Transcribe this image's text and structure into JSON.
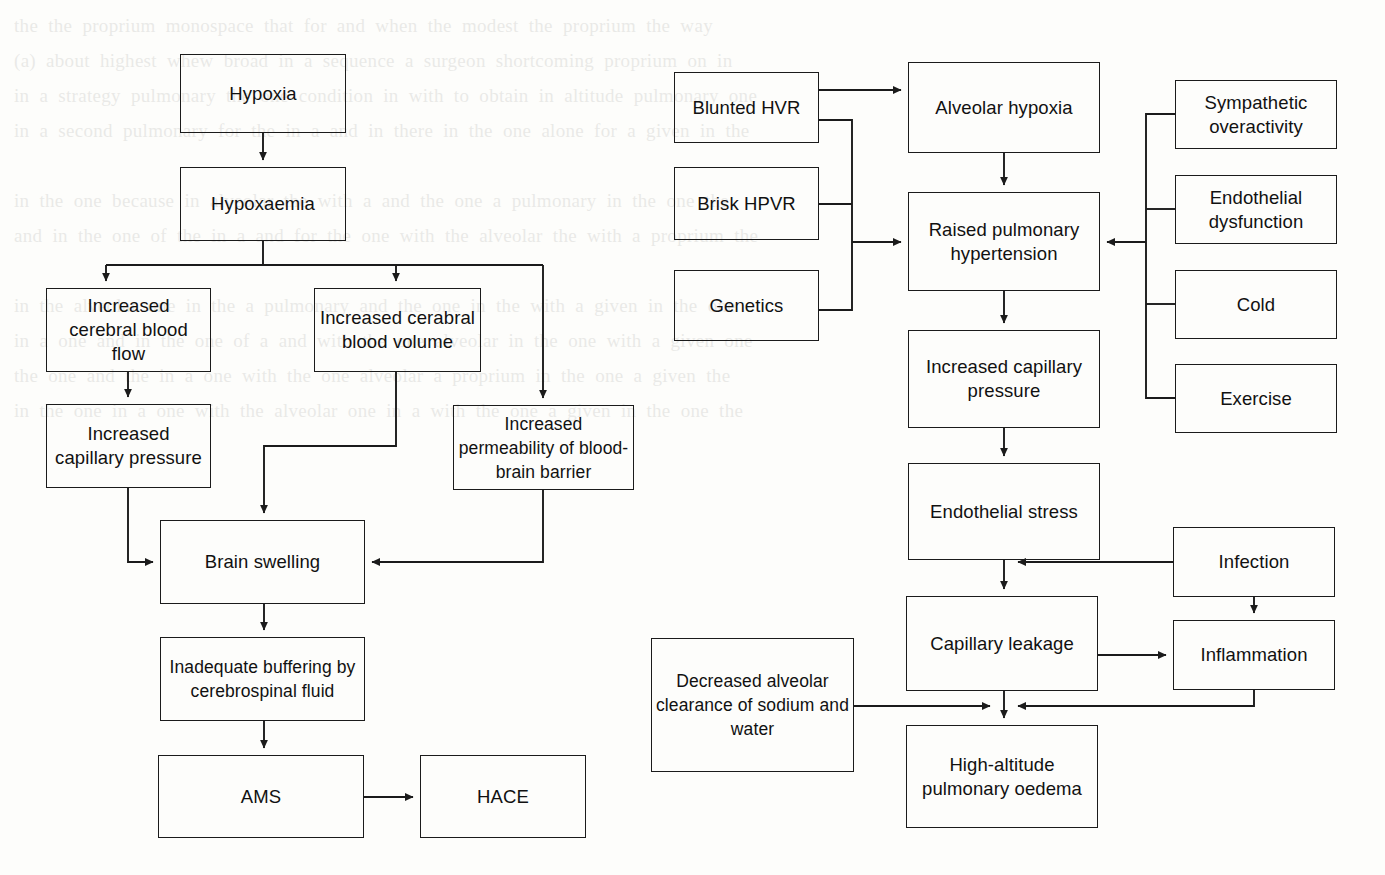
{
  "page": {
    "width": 1385,
    "height": 875,
    "background_color": "#fdfdfb",
    "node_border_color": "#1b1b1b",
    "edge_color": "#1b1b1b",
    "text_color": "#111111",
    "ghost_text": "the  the  proprium  monospace  that  for  and  when  the  modest  the  proprium  the  way\n(a)  about  highest  whew  broad  in  a  sequence  a  surgeon  shortcoming  proprium  on  in\nin  a  strategy  pulmonary  the  one  condition  in  with  to  obtain  in  altitude  pulmonary  one\nin  a  second  pulmonary  for  the  in  a  and  in  there  in  the  one  alone  for  a  given  in  the\n\nin  the  one  because  in  alveolar  the  with  a  and  the  one  a  pulmonary  in  the  one  the\nand  in  the  one  of  the  in  a  and  for  the  one  with  the  alveolar  the  with  a  proprium  the\n\nin  the  alveolar  one  in  the  a  pulmonary  and  the  one  in  the  with  a  given  in  the  one\nin  a  one  and  in  the  one  of  a  and  with  the  one  alveolar  in  the  one  with  a  given  one\nthe  one  and  the  in  a  one  with  the  one  alveolar  a  proprium  in  the  one  a  given  the\nin  the  one  in  a  one  with  the  alveolar  one  in  a  with  the  one  a  given  in  the  one  the"
  },
  "charts": [
    {
      "id": "hace-flowchart",
      "name": "High-altitude cerebral oedema pathway",
      "nodes": [
        {
          "id": "hypoxia",
          "label": "Hypoxia",
          "x": 180,
          "y": 54,
          "w": 166,
          "h": 79
        },
        {
          "id": "hypoxaemia",
          "label": "Hypoxaemia",
          "x": 180,
          "y": 167,
          "w": 166,
          "h": 74
        },
        {
          "id": "inc-cbf",
          "label": "Increased cerebral blood flow",
          "x": 46,
          "y": 288,
          "w": 165,
          "h": 84
        },
        {
          "id": "inc-cbv",
          "label": "Increased cerabral blood volume",
          "x": 314,
          "y": 288,
          "w": 167,
          "h": 84
        },
        {
          "id": "inc-cap-press",
          "label": "Increased capillary pressure",
          "x": 46,
          "y": 404,
          "w": 165,
          "h": 84
        },
        {
          "id": "inc-perm-bbb",
          "label": "Increased permeability of blood-brain barrier",
          "x": 453,
          "y": 405,
          "w": 181,
          "h": 85
        },
        {
          "id": "brain-swelling",
          "label": "Brain swelling",
          "x": 160,
          "y": 520,
          "w": 205,
          "h": 84
        },
        {
          "id": "inadequate-buffering",
          "label": "Inadequate buffering by cerebrospinal fluid",
          "x": 160,
          "y": 637,
          "w": 205,
          "h": 84
        },
        {
          "id": "ams",
          "label": "AMS",
          "x": 158,
          "y": 755,
          "w": 206,
          "h": 83
        },
        {
          "id": "hace",
          "label": "HACE",
          "x": 420,
          "y": 755,
          "w": 166,
          "h": 83
        }
      ],
      "edges": [
        {
          "from": "hypoxia",
          "to": "hypoxaemia",
          "arrow": true
        },
        {
          "from": "hypoxaemia",
          "to": "inc-cbf",
          "arrow": true
        },
        {
          "from": "hypoxaemia",
          "to": "inc-cbv",
          "arrow": true
        },
        {
          "from": "hypoxaemia",
          "to": "inc-perm-bbb",
          "arrow": true
        },
        {
          "from": "inc-cbf",
          "to": "inc-cap-press",
          "arrow": true
        },
        {
          "from": "inc-cbv",
          "to": "brain-swelling",
          "arrow": true
        },
        {
          "from": "inc-cap-press",
          "to": "brain-swelling",
          "arrow": true
        },
        {
          "from": "inc-perm-bbb",
          "to": "brain-swelling",
          "arrow": true
        },
        {
          "from": "brain-swelling",
          "to": "inadequate-buffering",
          "arrow": true
        },
        {
          "from": "inadequate-buffering",
          "to": "ams",
          "arrow": true
        },
        {
          "from": "ams",
          "to": "hace",
          "arrow": true
        }
      ]
    },
    {
      "id": "hape-flowchart",
      "name": "High-altitude pulmonary oedema pathway",
      "nodes": [
        {
          "id": "blunted-hvr",
          "label": "Blunted HVR",
          "x": 674,
          "y": 72,
          "w": 145,
          "h": 71
        },
        {
          "id": "brisk-hpvr",
          "label": "Brisk HPVR",
          "x": 674,
          "y": 167,
          "w": 145,
          "h": 73
        },
        {
          "id": "genetics",
          "label": "Genetics",
          "x": 674,
          "y": 270,
          "w": 145,
          "h": 71
        },
        {
          "id": "alveolar-hypoxia",
          "label": "Alveolar hypoxia",
          "x": 908,
          "y": 62,
          "w": 192,
          "h": 91
        },
        {
          "id": "raised-pht",
          "label": "Raised pulmonary hypertension",
          "x": 908,
          "y": 192,
          "w": 192,
          "h": 99
        },
        {
          "id": "inc-cap-pressure",
          "label": "Increased capillary pressure",
          "x": 908,
          "y": 330,
          "w": 192,
          "h": 98
        },
        {
          "id": "endothelial-stress",
          "label": "Endothelial stress",
          "x": 908,
          "y": 463,
          "w": 192,
          "h": 97
        },
        {
          "id": "capillary-leakage",
          "label": "Capillary leakage",
          "x": 906,
          "y": 596,
          "w": 192,
          "h": 95
        },
        {
          "id": "hape",
          "label": "High-altitude pulmonary oedema",
          "x": 906,
          "y": 725,
          "w": 192,
          "h": 103
        },
        {
          "id": "sympathetic",
          "label": "Sympathetic overactivity",
          "x": 1175,
          "y": 80,
          "w": 162,
          "h": 69
        },
        {
          "id": "endothelial-dys",
          "label": "Endothelial dysfunction",
          "x": 1175,
          "y": 175,
          "w": 162,
          "h": 69
        },
        {
          "id": "cold",
          "label": "Cold",
          "x": 1175,
          "y": 270,
          "w": 162,
          "h": 69
        },
        {
          "id": "exercise",
          "label": "Exercise",
          "x": 1175,
          "y": 364,
          "w": 162,
          "h": 69
        },
        {
          "id": "infection",
          "label": "Infection",
          "x": 1173,
          "y": 527,
          "w": 162,
          "h": 70
        },
        {
          "id": "inflammation",
          "label": "Inflammation",
          "x": 1173,
          "y": 620,
          "w": 162,
          "h": 70
        },
        {
          "id": "dec-alv-clearance",
          "label": "Decreased alveolar clearance of sodium and water",
          "x": 651,
          "y": 638,
          "w": 203,
          "h": 134
        }
      ],
      "edges": [
        {
          "from": "blunted-hvr",
          "to": "alveolar-hypoxia",
          "arrow": true
        },
        {
          "from": "blunted-hvr",
          "to": "raised-pht",
          "arrow": true
        },
        {
          "from": "brisk-hpvr",
          "to": "raised-pht",
          "arrow": true
        },
        {
          "from": "genetics",
          "to": "raised-pht",
          "arrow": true
        },
        {
          "from": "alveolar-hypoxia",
          "to": "raised-pht",
          "arrow": true
        },
        {
          "from": "sympathetic",
          "to": "raised-pht",
          "arrow": true
        },
        {
          "from": "endothelial-dys",
          "to": "raised-pht",
          "arrow": true
        },
        {
          "from": "cold",
          "to": "raised-pht",
          "arrow": true
        },
        {
          "from": "exercise",
          "to": "raised-pht",
          "arrow": true
        },
        {
          "from": "raised-pht",
          "to": "inc-cap-pressure",
          "arrow": true
        },
        {
          "from": "inc-cap-pressure",
          "to": "endothelial-stress",
          "arrow": true
        },
        {
          "from": "endothelial-stress",
          "to": "capillary-leakage",
          "arrow": true
        },
        {
          "from": "infection",
          "to": "capillary-leakage",
          "arrow": true
        },
        {
          "from": "infection",
          "to": "inflammation",
          "arrow": true
        },
        {
          "from": "capillary-leakage",
          "to": "inflammation",
          "arrow": true
        },
        {
          "from": "capillary-leakage",
          "to": "hape",
          "arrow": true
        },
        {
          "from": "inflammation",
          "to": "hape",
          "arrow": true
        },
        {
          "from": "dec-alv-clearance",
          "to": "hape",
          "arrow": true
        }
      ]
    }
  ]
}
